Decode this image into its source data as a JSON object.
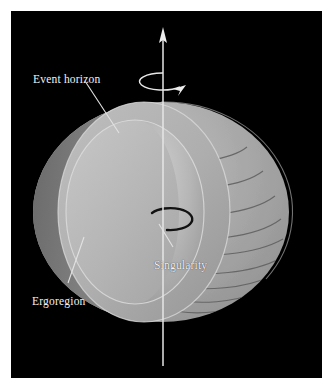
{
  "figure": {
    "domain": "diagram",
    "background_color": "#000000",
    "page_color": "#ffffff",
    "frame": {
      "x": 11,
      "y": 11,
      "width": 311,
      "height": 367
    },
    "labels": [
      {
        "id": "event-horizon",
        "text": "Event horizon",
        "color": "#f2f2f2",
        "x": 22,
        "y": 63,
        "leader": {
          "x1": 84,
          "y1": 79,
          "x2": 116,
          "y2": 131
        }
      },
      {
        "id": "ergoregion",
        "text": "Ergoregion",
        "color": "#f2f2f2",
        "x": 21,
        "y": 285,
        "leader": {
          "x1": 68,
          "y1": 281,
          "x2": 83,
          "y2": 236
        }
      },
      {
        "id": "singularity",
        "text": "Singularity",
        "color": "#f2f2f2",
        "x": 143,
        "y": 249,
        "leader": {
          "x1": 172,
          "y1": 246,
          "x2": 156,
          "y2": 222
        }
      }
    ],
    "spin_axis": {
      "name": "rotation-axis",
      "color": "#e8e8e8",
      "x": 163,
      "y_top": 21,
      "y_bottom": 366,
      "arrowhead": "up"
    },
    "spin_arrow": {
      "name": "rotation-direction-arrow",
      "color": "#e8e8e8",
      "center_x": 163,
      "center_y": 81,
      "rx": 23,
      "ry": 8
    },
    "ergoregion_surface": {
      "name": "ergosphere",
      "fill": "#a9a9a9",
      "shade_dark": "#6f6f6f",
      "shade_light": "#c4c4c4",
      "contour_color": "#5a5a5a",
      "contour_count": 9
    },
    "event_horizon_surface": {
      "name": "event-horizon",
      "fill": "#b8b8b8",
      "shade_dark": "#848484",
      "shade_light": "#cfcfcf"
    },
    "cut_face": {
      "name": "cut-away-face",
      "fill": "#b2b2b2",
      "rim": "#dadada"
    },
    "singularity_ring": {
      "name": "ring-singularity",
      "color": "#141414",
      "center_x": 163,
      "center_y": 211,
      "rx": 22,
      "ry": 11
    }
  }
}
